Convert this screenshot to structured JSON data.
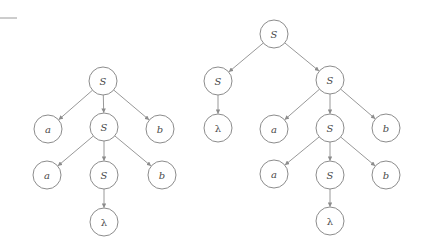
{
  "diagram": {
    "title": "",
    "style": {
      "stroke": "#8c8c8c",
      "text": "#4a4a4a",
      "background": "#ffffff",
      "radius": 14
    },
    "decor": {
      "rule": {
        "x1": 0,
        "y1": 18,
        "x2": 17,
        "y2": 18
      }
    },
    "trees": [
      {
        "name": "left-derivation-tree",
        "nodes": [
          {
            "id": "L0",
            "label": "S",
            "x": 103,
            "y": 81
          },
          {
            "id": "L1",
            "label": "a",
            "x": 48,
            "y": 129
          },
          {
            "id": "L2",
            "label": "S",
            "x": 104,
            "y": 127
          },
          {
            "id": "L3",
            "label": "b",
            "x": 160,
            "y": 129
          },
          {
            "id": "L4",
            "label": "a",
            "x": 47,
            "y": 175
          },
          {
            "id": "L5",
            "label": "S",
            "x": 104,
            "y": 175
          },
          {
            "id": "L6",
            "label": "b",
            "x": 162,
            "y": 175
          },
          {
            "id": "L7",
            "label": "λ",
            "x": 104,
            "y": 222
          }
        ],
        "edges": [
          [
            "L0",
            "L1"
          ],
          [
            "L0",
            "L2"
          ],
          [
            "L0",
            "L3"
          ],
          [
            "L2",
            "L4"
          ],
          [
            "L2",
            "L5"
          ],
          [
            "L2",
            "L6"
          ],
          [
            "L5",
            "L7"
          ]
        ]
      },
      {
        "name": "right-derivation-tree",
        "nodes": [
          {
            "id": "R0",
            "label": "S",
            "x": 274,
            "y": 34
          },
          {
            "id": "R1",
            "label": "S",
            "x": 218,
            "y": 81
          },
          {
            "id": "R2",
            "label": "S",
            "x": 330,
            "y": 80
          },
          {
            "id": "R3",
            "label": "λ",
            "x": 218,
            "y": 128
          },
          {
            "id": "R4",
            "label": "a",
            "x": 274,
            "y": 129
          },
          {
            "id": "R5",
            "label": "S",
            "x": 330,
            "y": 128
          },
          {
            "id": "R6",
            "label": "b",
            "x": 386,
            "y": 128
          },
          {
            "id": "R7",
            "label": "a",
            "x": 274,
            "y": 174
          },
          {
            "id": "R8",
            "label": "S",
            "x": 330,
            "y": 175
          },
          {
            "id": "R9",
            "label": "b",
            "x": 386,
            "y": 175
          },
          {
            "id": "R10",
            "label": "λ",
            "x": 330,
            "y": 221
          }
        ],
        "edges": [
          [
            "R0",
            "R1"
          ],
          [
            "R0",
            "R2"
          ],
          [
            "R1",
            "R3"
          ],
          [
            "R2",
            "R4"
          ],
          [
            "R2",
            "R5"
          ],
          [
            "R2",
            "R6"
          ],
          [
            "R5",
            "R7"
          ],
          [
            "R5",
            "R8"
          ],
          [
            "R5",
            "R9"
          ],
          [
            "R8",
            "R10"
          ]
        ]
      }
    ]
  }
}
